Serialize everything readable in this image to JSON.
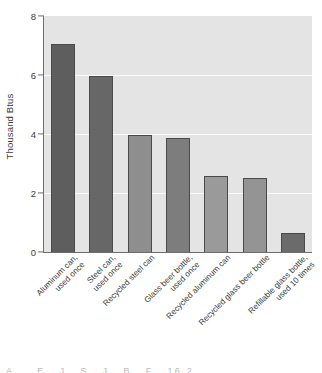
{
  "chart_data": {
    "type": "bar",
    "title": "",
    "xlabel": "",
    "ylabel": "Thousand Btus",
    "ylim": [
      0,
      8
    ],
    "yticks": [
      0,
      2,
      4,
      6,
      8
    ],
    "ytick_labels": [
      "0",
      "2",
      "4",
      "6",
      "8"
    ],
    "grid": true,
    "gridline_values": [
      2,
      4,
      6
    ],
    "legend": "none",
    "categories": [
      "Aluminum can, used once",
      "Steel can, used once",
      "Recycled steel can",
      "Glass beer bottle, used once",
      "Recycled aluminum can",
      "Recycled glass beer bottle",
      "Refillable glass bottle, used 10 times"
    ],
    "category_lines": [
      [
        "Aluminum can,",
        "used once"
      ],
      [
        "Steel can,",
        "used once"
      ],
      [
        "Recycled steel can",
        ""
      ],
      [
        "Glass beer bottle,",
        "used once"
      ],
      [
        "Recycled aluminum can",
        ""
      ],
      [
        "Recycled glass beer bottle",
        ""
      ],
      [
        "Refillable glass bottle,",
        "used 10 times"
      ]
    ],
    "values": [
      7.05,
      5.95,
      3.97,
      3.87,
      2.58,
      2.5,
      0.65
    ],
    "bar_colors": [
      "#5e5e5e",
      "#676767",
      "#8e8e8e",
      "#7d7d7d",
      "#9a9a9a",
      "#949494",
      "#6b6b6b"
    ]
  },
  "style": {
    "plot_background": "#e4e4e4",
    "gridline_color": "#fbfbfb",
    "axis_color": "#6e6e6e",
    "bar_edge_color": "#4a4a4a",
    "text_color": "#3a3a3a",
    "page_background": "#ffffff"
  },
  "bottom_caption": {
    "text": "A . . E . J . S . J . B . F . 16.2"
  }
}
